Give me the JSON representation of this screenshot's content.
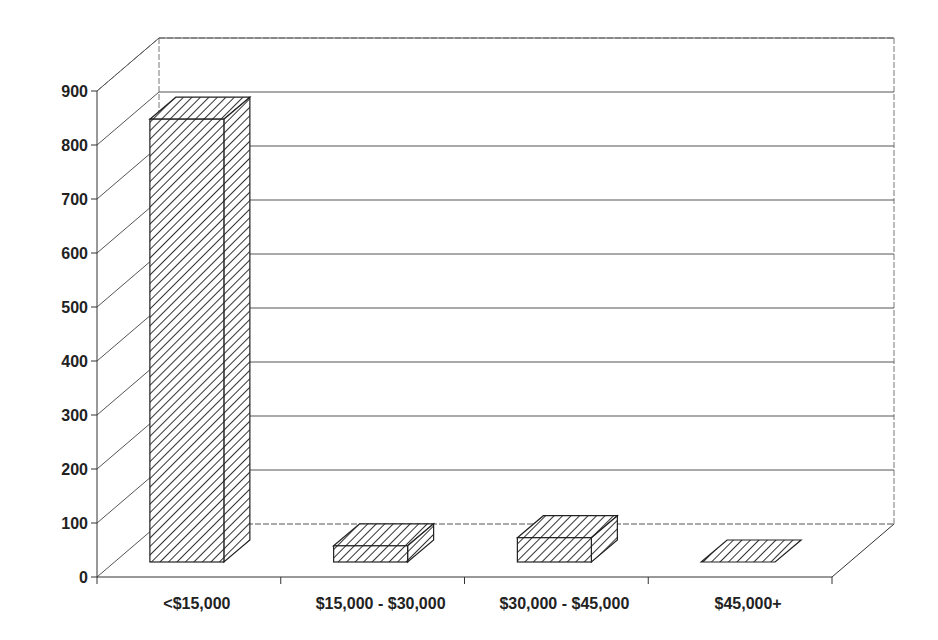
{
  "chart_data": {
    "type": "bar",
    "style": "3d-column",
    "title": "",
    "xlabel": "",
    "ylabel": "",
    "categories": [
      "<$15,000",
      "$15,000 - $30,000",
      "$30,000 - $45,000",
      "$45,000+"
    ],
    "values": [
      820,
      30,
      45,
      0
    ],
    "ylim": [
      0,
      900
    ],
    "yticks": [
      0,
      100,
      200,
      300,
      400,
      500,
      600,
      700,
      800,
      900
    ],
    "ytick_labels": [
      "0",
      "100",
      "200",
      "300",
      "400",
      "500",
      "600",
      "700",
      "800",
      "900"
    ],
    "grid": true,
    "legend": null,
    "fill_pattern": "diagonal-hatch",
    "colors": {
      "bar_stroke": "#222222",
      "hatch": "#333333",
      "grid": "#555555",
      "background": "#ffffff"
    }
  }
}
